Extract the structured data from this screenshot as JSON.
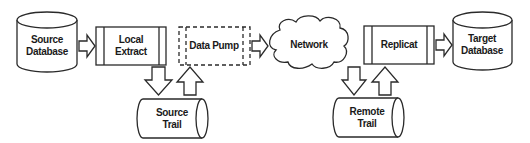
{
  "diagram": {
    "type": "data-replication-flow",
    "stroke_color": "#2a2a2a",
    "fill_color": "#ffffff",
    "nodes": {
      "source_database": {
        "shape": "cylinder",
        "line1": "Source",
        "line2": "Database"
      },
      "local_extract": {
        "shape": "process-box",
        "line1": "Local",
        "line2": "Extract"
      },
      "data_pump": {
        "shape": "dashed-process-box",
        "label": "Data Pump"
      },
      "network": {
        "shape": "cloud",
        "label": "Network"
      },
      "replicat": {
        "shape": "process-box",
        "label": "Replicat"
      },
      "target_database": {
        "shape": "cylinder",
        "line1": "Target",
        "line2": "Database"
      },
      "source_trail": {
        "shape": "horizontal-cylinder",
        "line1": "Source",
        "line2": "Trail"
      },
      "remote_trail": {
        "shape": "horizontal-cylinder",
        "line1": "Remote",
        "line2": "Trail"
      }
    },
    "edges": [
      {
        "from": "Source Database",
        "to": "Local Extract",
        "direction": "right"
      },
      {
        "from": "Local Extract",
        "to": "Source Trail",
        "direction": "down"
      },
      {
        "from": "Source Trail",
        "to": "Data Pump",
        "direction": "up"
      },
      {
        "from": "Data Pump",
        "to": "Network",
        "direction": "right"
      },
      {
        "from": "Network",
        "to": "Remote Trail",
        "direction": "down"
      },
      {
        "from": "Remote Trail",
        "to": "Replicat",
        "direction": "up"
      },
      {
        "from": "Replicat",
        "to": "Target Database",
        "direction": "right"
      }
    ]
  }
}
